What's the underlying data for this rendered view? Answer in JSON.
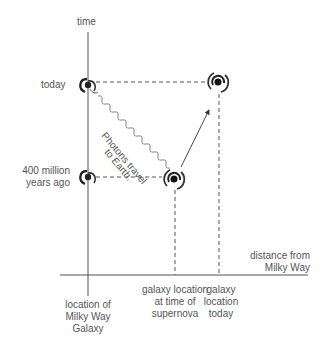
{
  "diagram": {
    "top_cut_text": "",
    "axes": {
      "y_label": "time",
      "x_label_line1": "distance from",
      "x_label_line2": "Milky Way"
    },
    "time_labels": {
      "today": "today",
      "past_line1": "400 million",
      "past_line2": "years ago"
    },
    "x_labels": {
      "milky_way": [
        "location of",
        "Milky Way",
        "Galaxy"
      ],
      "supernova": [
        "galaxy location",
        "at time of",
        "supernova"
      ],
      "today": [
        "galaxy",
        "location",
        "today"
      ]
    },
    "annotation": {
      "line1": "Photons travel",
      "line2": "to Earth."
    },
    "colors": {
      "line": "#555555",
      "galaxy": "#222222",
      "text": "#555555"
    }
  }
}
